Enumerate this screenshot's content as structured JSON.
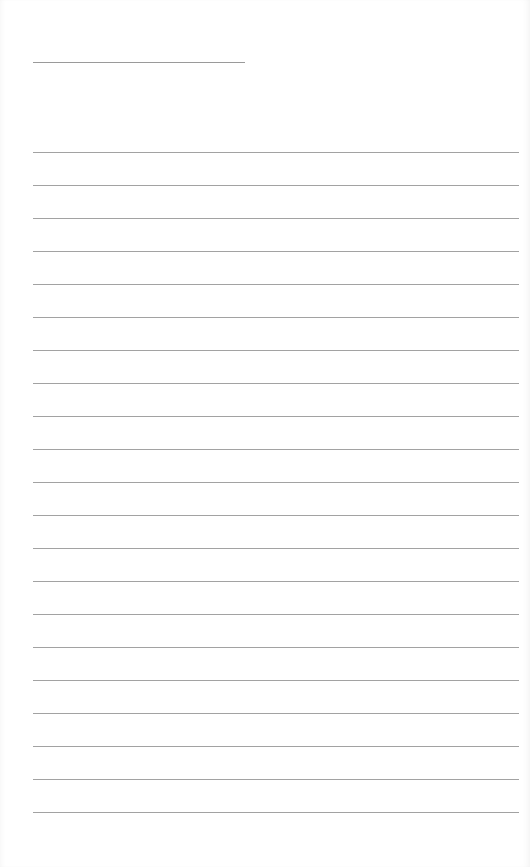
{
  "document": {
    "type": "lined-paper",
    "title": "",
    "title_line_count": 1,
    "ruled_line_count": 21,
    "lines": [
      "",
      "",
      "",
      "",
      "",
      "",
      "",
      "",
      "",
      "",
      "",
      "",
      "",
      "",
      "",
      "",
      "",
      "",
      "",
      "",
      ""
    ],
    "colors": {
      "paper": "#ffffff",
      "rule": "#a2a2a2"
    }
  }
}
